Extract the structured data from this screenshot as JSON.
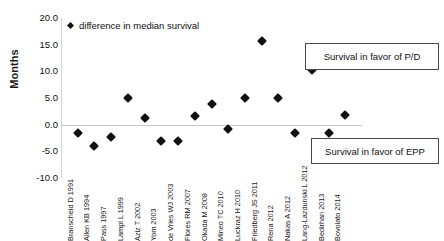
{
  "chart_data": {
    "type": "scatter",
    "title": "",
    "xlabel": "",
    "ylabel": "Months",
    "ylim": [
      -10.0,
      20.0
    ],
    "yticks": [
      "20.0",
      "15.0",
      "10.0",
      "5.0",
      "0.0",
      "-5.0",
      "-10.0"
    ],
    "ytick_values": [
      20.0,
      15.0,
      10.0,
      5.0,
      0.0,
      -5.0,
      -10.0
    ],
    "grid": false,
    "legend": {
      "position": "top-left-inside",
      "entries": [
        "difference in median survival"
      ]
    },
    "zero_reference_line": 0.0,
    "categories": [
      "Branscheid D 1991",
      "Allen KB 1994",
      "Pass 1997",
      "Lampl L 1999",
      "Aziz T 2002",
      "Yom 2003",
      "de Vries WJ 2003",
      "Flores RM 2007",
      "Okada M 2008",
      "Mineo TC 2010",
      "Luckraz H 2010",
      "Friedberg JS 2011",
      "Rena 2012",
      "Nakas A 2012",
      "Lang-Lazdunski L 2012",
      "Bedirhan 2013",
      "Bovolato 2014"
    ],
    "series": [
      {
        "name": "difference in median survival",
        "marker": "diamond",
        "color": "#111111",
        "values": [
          -1.5,
          -4.0,
          -2.3,
          5.0,
          1.2,
          -3.0,
          -3.0,
          1.7,
          3.9,
          -0.9,
          5.0,
          15.7,
          5.0,
          -1.6,
          10.2,
          -1.5,
          1.8
        ]
      }
    ],
    "annotations": [
      {
        "name": "survival-in-favor-of-pd",
        "text": "Survival in favor of P/D",
        "region": "above-zero"
      },
      {
        "name": "survival-in-favor-of-epp",
        "text": "Survival in favor of EPP",
        "region": "below-zero"
      }
    ]
  },
  "axis": {
    "y_title": "Months"
  },
  "legend": {
    "label": "difference in median survival"
  },
  "annotations": {
    "pd": "Survival in favor of P/D",
    "epp": "Survival in favor of EPP"
  }
}
